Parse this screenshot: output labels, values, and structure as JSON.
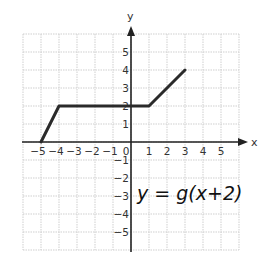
{
  "chart_data": {
    "type": "line",
    "title": "",
    "xlabel": "x",
    "ylabel": "y",
    "xlim": [
      -6,
      6
    ],
    "ylim": [
      -6,
      6
    ],
    "grid": true,
    "x_ticks": [
      -5,
      -4,
      -3,
      -2,
      -1,
      0,
      1,
      2,
      3,
      4,
      5
    ],
    "y_ticks": [
      -5,
      -4,
      -3,
      -2,
      -1,
      1,
      2,
      3,
      4,
      5
    ],
    "x_tick_labels": [
      "−5",
      "−4",
      "−3",
      "−2",
      "−1",
      "0",
      "1",
      "2",
      "3",
      "4",
      "5"
    ],
    "y_tick_labels": [
      "5",
      "4",
      "3",
      "2",
      "1",
      "−1",
      "−2",
      "−3",
      "−4",
      "−5"
    ],
    "series": [
      {
        "name": "y = g(x + 2)",
        "points": [
          [
            -5,
            0
          ],
          [
            -4,
            2
          ],
          [
            1,
            2
          ],
          [
            3,
            4
          ]
        ]
      }
    ],
    "annotations": [
      {
        "text": "y = g(x+2)",
        "x": 3,
        "y": -2.5,
        "style": "handwritten"
      }
    ]
  },
  "labels": {
    "x_axis": "x",
    "y_axis": "y",
    "annotation": "y = g(x+2)"
  }
}
